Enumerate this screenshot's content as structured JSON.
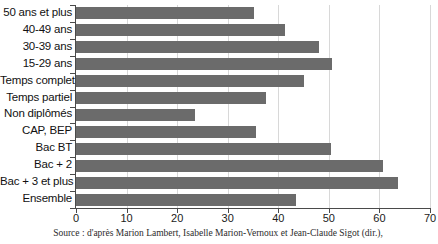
{
  "chart_data": {
    "type": "bar",
    "orientation": "horizontal",
    "title": "",
    "xlabel": "",
    "ylabel": "",
    "xlim": [
      0,
      70
    ],
    "xticks": [
      0,
      10,
      20,
      30,
      40,
      50,
      60,
      70
    ],
    "xtick_labels": [
      "0",
      "10",
      "20",
      "30",
      "40",
      "50",
      "60",
      "70"
    ],
    "grid": true,
    "grid_axis": "x",
    "legend": false,
    "bar_color": "#6b6b6b",
    "axis_color": "#4a4a4a",
    "grid_color": "#d8d8d8",
    "categories": [
      "50 ans et plus",
      "40-49 ans",
      "30-39 ans",
      "15-29 ans",
      "Temps complet",
      "Temps partiel",
      "Non diplômés",
      "CAP, BEP",
      "Bac BT",
      "Bac + 2",
      "Bac + 3 et plus",
      "Ensemble"
    ],
    "values": [
      35.2,
      41.3,
      48,
      50.6,
      45,
      37.6,
      23.5,
      35.6,
      50.4,
      60.7,
      63.7,
      43.5
    ]
  },
  "source": {
    "text": "Source : d'après Marion Lambert, Isabelle Marion-Vernoux et Jean-Claude Sigot (dir.),"
  }
}
